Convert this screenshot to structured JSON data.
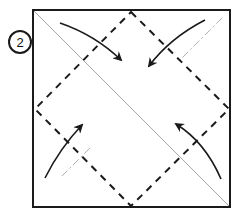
{
  "diagram": {
    "step_number": "2",
    "elements": {
      "paper": "square sheet",
      "valley_folds": "dashed diamond connecting edge midpoints",
      "existing_creases": [
        "diagonal top-left to bottom-right (thin grey)",
        "diagonal top-right to bottom-left (grey dash-dot)"
      ],
      "arrows": [
        {
          "from": "top-left corner",
          "to": "center",
          "label": "fold corner to center"
        },
        {
          "from": "top-right corner",
          "to": "center",
          "label": "fold corner to center"
        },
        {
          "from": "bottom-left corner",
          "to": "center",
          "label": "fold corner to center"
        },
        {
          "from": "bottom-right corner",
          "to": "center",
          "label": "fold corner to center"
        }
      ]
    },
    "colors": {
      "line": "#1a1a1a",
      "crease": "#b0b0b0",
      "background": "#ffffff"
    }
  }
}
